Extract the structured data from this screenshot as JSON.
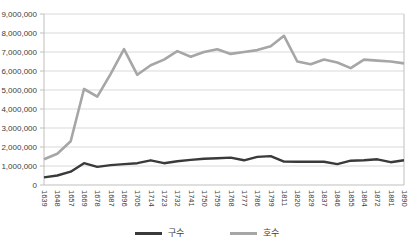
{
  "chart_data": {
    "type": "line",
    "title": "",
    "xlabel": "",
    "ylabel": "",
    "ylim": [
      0,
      9000000
    ],
    "grid": true,
    "legend_position": "bottom",
    "y_ticks": [
      "0",
      "1,000,000",
      "2,000,000",
      "3,000,000",
      "4,000,000",
      "5,000,000",
      "6,000,000",
      "7,000,000",
      "8,000,000",
      "9,000,000"
    ],
    "categories": [
      "1639",
      "1648",
      "1657",
      "1669",
      "1678",
      "1687",
      "1696",
      "1705",
      "1714",
      "1723",
      "1732",
      "1741",
      "1750",
      "1759",
      "1768",
      "1777",
      "1786",
      "1799",
      "1811",
      "1820",
      "1829",
      "1837",
      "1846",
      "1855",
      "1864",
      "1872",
      "1881",
      "1890"
    ],
    "series": [
      {
        "name": "구수",
        "color": "#3a3a3a",
        "values": [
          400000,
          500000,
          700000,
          1150000,
          950000,
          1050000,
          1100000,
          1150000,
          1300000,
          1150000,
          1250000,
          1320000,
          1380000,
          1410000,
          1440000,
          1300000,
          1480000,
          1520000,
          1230000,
          1220000,
          1230000,
          1220000,
          1100000,
          1280000,
          1300000,
          1350000,
          1200000,
          1300000
        ]
      },
      {
        "name": "호수",
        "color": "#a6a6a6",
        "values": [
          1350000,
          1650000,
          2300000,
          5050000,
          4650000,
          5850000,
          7150000,
          5800000,
          6300000,
          6600000,
          7050000,
          6750000,
          7000000,
          7150000,
          6900000,
          7000000,
          7100000,
          7300000,
          7850000,
          6500000,
          6350000,
          6600000,
          6450000,
          6150000,
          6600000,
          6550000,
          6500000,
          6400000
        ]
      }
    ],
    "colors": {
      "gridline": "#d9d9d9",
      "axis": "#bfbfbf",
      "tick_text": "#404040"
    }
  }
}
